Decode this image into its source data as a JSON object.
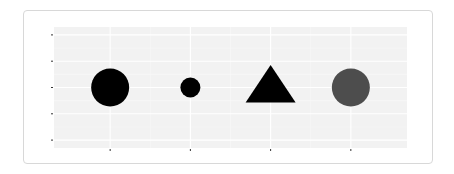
{
  "chart_data": {
    "type": "scatter",
    "title": "",
    "xlabel": "",
    "ylabel": "",
    "categories": [
      "",
      "",
      "",
      ""
    ],
    "x_ticks": [
      1,
      2,
      3,
      4
    ],
    "y_ticks": [
      0,
      1,
      2,
      3,
      4
    ],
    "x_tick_labels": [
      "",
      "",
      "",
      ""
    ],
    "y_tick_labels": [
      "",
      "",
      "",
      "",
      ""
    ],
    "xlim": [
      0.3,
      4.7
    ],
    "ylim": [
      -0.3,
      4.3
    ],
    "grid": true,
    "legend": null,
    "points": [
      {
        "x": 1,
        "y": 2,
        "shape": "circle",
        "size": "large",
        "radius_px": 19,
        "color": "#000000"
      },
      {
        "x": 2,
        "y": 2,
        "shape": "circle",
        "size": "small",
        "radius_px": 10,
        "color": "#000000"
      },
      {
        "x": 3,
        "y": 2,
        "shape": "triangle",
        "size": "large",
        "half_width_px": 25,
        "color": "#000000"
      },
      {
        "x": 4,
        "y": 2,
        "shape": "circle",
        "size": "large",
        "radius_px": 19,
        "color": "#4d4d4d"
      }
    ]
  },
  "colors": {
    "panel_background": "#f2f2f2",
    "grid_major": "#ffffff",
    "grid_minor": "#f8f8f8",
    "tick": "#333333",
    "card_border": "#d8d8d8"
  }
}
